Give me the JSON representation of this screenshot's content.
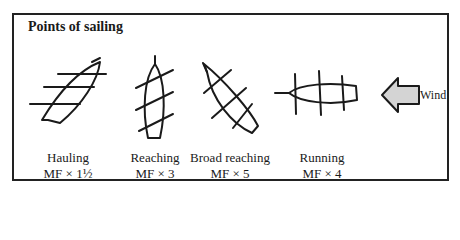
{
  "title": "Points of sailing",
  "wind_label": "Wind",
  "points": [
    {
      "name": "Hauling",
      "factor": "MF × 1½"
    },
    {
      "name": "Reaching",
      "factor": "MF × 3"
    },
    {
      "name": "Broad reaching",
      "factor": "MF × 5"
    },
    {
      "name": "Running",
      "factor": "MF × 4"
    }
  ],
  "colors": {
    "line": "#1a1a1a",
    "arrow_fill": "#d4d4d4"
  }
}
